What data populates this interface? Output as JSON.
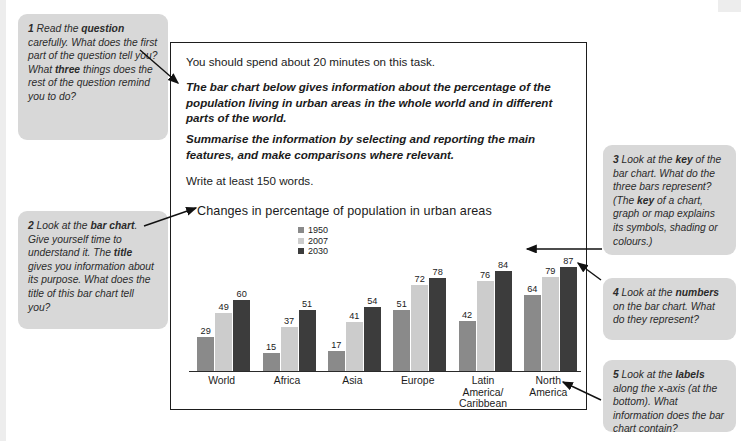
{
  "callouts": [
    {
      "id": "callout-1",
      "number": "1",
      "text_parts": [
        "Read the ",
        "question",
        " carefully. What does the first part of the question tell you? What ",
        "three",
        " things does the rest of the question remind you to do?"
      ]
    },
    {
      "id": "callout-2",
      "number": "2",
      "text_parts": [
        "Look at the ",
        "bar chart",
        ". Give yourself time to understand it. The ",
        "title",
        " gives you information about its purpose. What does the title of this bar chart tell you?"
      ]
    },
    {
      "id": "callout-3",
      "number": "3",
      "text_parts": [
        "Look at the ",
        "key",
        " of the bar chart. What do the three bars represent? (The ",
        "key",
        " of a chart, graph or map explains its symbols, shading or colours.)"
      ]
    },
    {
      "id": "callout-4",
      "number": "4",
      "text_parts": [
        "Look at the ",
        "numbers",
        " on the bar chart. What do they represent?"
      ]
    },
    {
      "id": "callout-5",
      "number": "5",
      "text_parts": [
        "Look at the ",
        "labels",
        " along the x-axis (at the bottom). What information does the bar chart contain?"
      ]
    }
  ],
  "task": {
    "line_1": "You should spend about 20 minutes on this task.",
    "line_2": "The bar chart below gives information about the percentage of the population living in urban areas in the whole world and in different parts of the world.",
    "line_3": "Summarise the information by selecting and reporting the main features, and make comparisons where relevant.",
    "line_4": "Write at least 150 words."
  },
  "chart_data": {
    "type": "bar",
    "title": "Changes in percentage of population in urban areas",
    "xlabel": "",
    "ylabel": "",
    "ylim": [
      0,
      100
    ],
    "grid": false,
    "legend_position": "top-center",
    "categories": [
      "World",
      "Africa",
      "Asia",
      "Europe",
      "Latin America/ Caribbean",
      "North America"
    ],
    "series": [
      {
        "name": "1950",
        "color": "#8a8a8a",
        "values": [
          29,
          15,
          17,
          51,
          42,
          64
        ]
      },
      {
        "name": "2007",
        "color": "#cccccc",
        "values": [
          49,
          37,
          41,
          72,
          76,
          79
        ]
      },
      {
        "name": "2030",
        "color": "#3c3c3c",
        "values": [
          60,
          51,
          54,
          78,
          84,
          87
        ]
      }
    ]
  },
  "colors": {
    "callout_background": "#d8d8d8",
    "panel_border": "#1d1d1d",
    "text": "#1b1b1b",
    "bar_1950": "#8a8a8a",
    "bar_2007": "#cccccc",
    "bar_2030": "#3c3c3c"
  }
}
